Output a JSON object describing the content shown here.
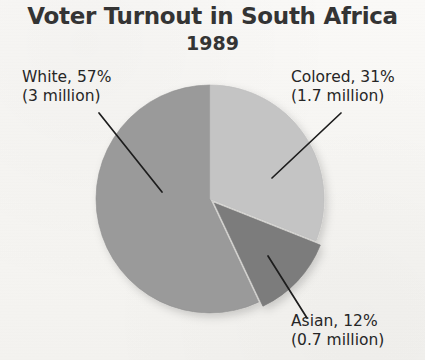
{
  "chart_data": {
    "type": "pie",
    "title": "Voter Turnout in South Africa",
    "subtitle": "1989",
    "xlabel": "",
    "ylabel": "",
    "units": "percent of voter turnout",
    "start_angle_deg": 0,
    "direction": "clockwise",
    "legend": "none (direct labels with leader lines)",
    "grid": false,
    "categories": [
      "Colored",
      "Asian",
      "White"
    ],
    "values": [
      31,
      12,
      57
    ],
    "absolute_values_millions": [
      1.7,
      0.7,
      3
    ],
    "colors": [
      "#c4c4c4",
      "#7c7c7c",
      "#9a9a9a"
    ],
    "slices": [
      {
        "name": "Colored",
        "percent": 31,
        "percent_text": "31%",
        "millions": 1.7,
        "label_line1": "Colored, 31%",
        "label_line2": "(1.7 million)",
        "color": "#c4c4c4",
        "start_deg": 0,
        "end_deg": 111.6,
        "exploded": false
      },
      {
        "name": "Asian",
        "percent": 12,
        "percent_text": "12%",
        "millions": 0.7,
        "label_line1": "Asian, 12%",
        "label_line2": "(0.7 million)",
        "color": "#7c7c7c",
        "start_deg": 111.6,
        "end_deg": 154.8,
        "exploded": true
      },
      {
        "name": "White",
        "percent": 57,
        "percent_text": "57%",
        "millions": 3,
        "label_line1": "White, 57%",
        "label_line2": "(3 million)",
        "color": "#9a9a9a",
        "start_deg": 154.8,
        "end_deg": 360,
        "exploded": false
      }
    ]
  },
  "figure": {
    "title": "Voter Turnout in South Africa",
    "subtitle": "1989",
    "background_color": "#f8f7f5",
    "title_color": "#343434"
  },
  "labels": {
    "white": {
      "line1": "White, 57%",
      "line2": "(3 million)"
    },
    "colored": {
      "line1": "Colored, 31%",
      "line2": "(1.7 million)"
    },
    "asian": {
      "line1": "Asian, 12%",
      "line2": "(0.7 million)"
    }
  }
}
